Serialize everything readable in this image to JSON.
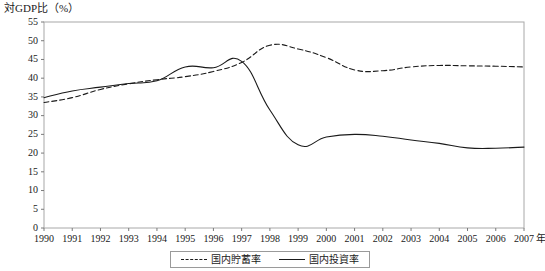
{
  "chart_data": {
    "type": "line",
    "title": "対GDP比（%）",
    "xlabel": "年",
    "ylabel": "対GDP比（%）",
    "ylim": [
      0,
      55
    ],
    "ytick_step": 5,
    "yticks": [
      0,
      5,
      10,
      15,
      20,
      25,
      30,
      35,
      40,
      45,
      50,
      55
    ],
    "grid": false,
    "legend_position": "bottom",
    "x": [
      1990,
      1991,
      1992,
      1993,
      1994,
      1995,
      1996,
      1997,
      1998,
      1999,
      2000,
      2001,
      2002,
      2003,
      2004,
      2005,
      2006,
      2007
    ],
    "categories": [
      "1990",
      "1991",
      "1992",
      "1993",
      "1994",
      "1995",
      "1996",
      "1997",
      "1998",
      "1999",
      "2000",
      "2001",
      "2002",
      "2003",
      "2004",
      "2005",
      "2006",
      "2007"
    ],
    "series": [
      {
        "name": "国内貯蓄率",
        "style": "dashed",
        "color": "#1a1a1a",
        "values": [
          33.5,
          34.8,
          37.0,
          38.5,
          39.6,
          40.4,
          41.8,
          44.2,
          48.8,
          47.8,
          45.5,
          42.2,
          42.0,
          43.0,
          43.4,
          43.3,
          43.2,
          43.0
        ]
      },
      {
        "name": "国内投資率",
        "style": "solid",
        "color": "#1a1a1a",
        "values": [
          34.8,
          36.6,
          37.6,
          38.6,
          39.3,
          43.0,
          42.8,
          44.5,
          31.5,
          22.2,
          24.3,
          25.0,
          24.5,
          23.5,
          22.6,
          21.4,
          21.3,
          21.6
        ]
      }
    ],
    "axis_unit_suffix": "年"
  },
  "legend": {
    "items": [
      {
        "label": "国内貯蓄率",
        "style": "dashed"
      },
      {
        "label": "国内投資率",
        "style": "solid"
      }
    ]
  },
  "plot_geometry": {
    "left": 44,
    "right": 524,
    "top": 22,
    "bottom": 228
  }
}
